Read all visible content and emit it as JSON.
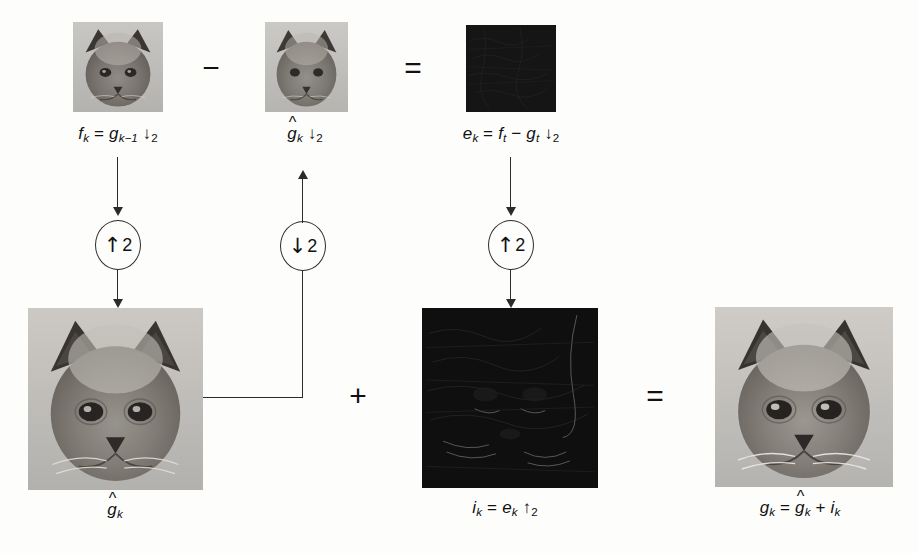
{
  "figure": {
    "background_color": "#fdfdfc",
    "ink_color": "#2b2b2b"
  },
  "top_row": {
    "images": [
      {
        "name": "f-k-image",
        "kind": "cat-photo",
        "label_id": "label-fk"
      },
      {
        "name": "g-hat-k-image",
        "kind": "cat-photo",
        "label_id": "label-ghatk"
      },
      {
        "name": "e-k-image",
        "kind": "dark-residual",
        "label_id": "label-ek"
      }
    ],
    "labels": {
      "f_k": {
        "base": "f",
        "sub": "k",
        "rest_eq": "=",
        "term": "g",
        "term_sub": "k−1",
        "arrow": "↓",
        "arrow_sub": "2"
      },
      "g_hat_k": {
        "base": "g",
        "hat": "^",
        "sub": "k",
        "arrow": "↓",
        "arrow_sub": "2"
      },
      "e_k": {
        "base": "e",
        "sub": "k",
        "rest_eq": "=",
        "t1": "f",
        "t1_sub": "t",
        "minus": "−",
        "t2": "g",
        "t2_sub": "t",
        "arrow": "↓",
        "arrow_sub": "2"
      }
    },
    "operators": [
      {
        "name": "minus-operator",
        "glyph": "−"
      },
      {
        "name": "equals-operator-top",
        "glyph": "="
      }
    ]
  },
  "bottom_row": {
    "images": [
      {
        "name": "g-hat-k-large-image",
        "kind": "cat-photo",
        "label_id": "label-ghatk-large"
      },
      {
        "name": "i-k-image",
        "kind": "dark-residual",
        "label_id": "label-ik"
      },
      {
        "name": "g-k-image",
        "kind": "cat-photo",
        "label_id": "label-gk"
      }
    ],
    "labels": {
      "g_hat_k": {
        "base": "g",
        "hat": "^",
        "sub": "k"
      },
      "i_k": {
        "base": "i",
        "sub": "k",
        "eq": "=",
        "term": "e",
        "term_sub": "k",
        "arrow": "↑",
        "arrow_sub": "2"
      },
      "g_k": {
        "base": "g",
        "sub": "k",
        "eq": "=",
        "t1": "g",
        "t1_hat": "^",
        "t1_sub": "k",
        "plus": "+",
        "t2": "i",
        "t2_sub": "k"
      }
    },
    "operators": [
      {
        "name": "plus-operator",
        "glyph": "+"
      },
      {
        "name": "equals-operator-bottom",
        "glyph": "="
      }
    ]
  },
  "samplers": [
    {
      "name": "upsample-2-left",
      "direction": "↑",
      "factor": "2",
      "meaning": "upsample-by-2"
    },
    {
      "name": "downsample-2-mid",
      "direction": "↓",
      "factor": "2",
      "meaning": "downsample-by-2"
    },
    {
      "name": "upsample-2-right",
      "direction": "↑",
      "factor": "2",
      "meaning": "upsample-by-2"
    }
  ],
  "connectors": [
    {
      "name": "wire-fk-to-upsampler",
      "from": "f-k-image",
      "to": "upsample-2-left"
    },
    {
      "name": "wire-upsampler-to-ghatk",
      "from": "upsample-2-left",
      "to": "g-hat-k-large-image"
    },
    {
      "name": "wire-ghatk-to-downsampler",
      "from": "g-hat-k-large-image",
      "to": "downsample-2-mid"
    },
    {
      "name": "wire-downsampler-to-ghatk2",
      "from": "downsample-2-mid",
      "to": "g-hat-k-image"
    },
    {
      "name": "wire-ek-to-upsampler",
      "from": "e-k-image",
      "to": "upsample-2-right"
    },
    {
      "name": "wire-upsampler-to-ik",
      "from": "upsample-2-right",
      "to": "i-k-image"
    }
  ]
}
